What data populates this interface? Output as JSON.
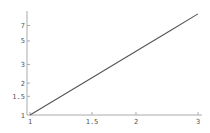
{
  "chart_data": {
    "type": "line",
    "title": "",
    "xlabel": "",
    "ylabel": "",
    "xscale": "log",
    "yscale": "log",
    "xlim": [
      1,
      3
    ],
    "ylim": [
      1,
      9
    ],
    "grid": false,
    "legend": null,
    "x_ticks": [
      {
        "value": 1,
        "label": "1"
      },
      {
        "value": 1.5,
        "label": "1.5"
      },
      {
        "value": 2,
        "label": "2"
      },
      {
        "value": 3,
        "label": "3"
      }
    ],
    "y_ticks": [
      {
        "value": 1,
        "label": "1"
      },
      {
        "value": 1.5,
        "label": "1.5"
      },
      {
        "value": 2,
        "label": "2"
      },
      {
        "value": 3,
        "label": "3"
      },
      {
        "value": 5,
        "label": "5"
      },
      {
        "value": 7,
        "label": "7"
      }
    ],
    "series": [
      {
        "name": "y = x^2",
        "x": [
          1,
          1.5,
          2,
          2.5,
          3
        ],
        "y": [
          1,
          2.25,
          4,
          6.25,
          9
        ],
        "color": "#555555"
      }
    ]
  },
  "colors": {
    "axis": "#aaaaaa",
    "line": "#555555",
    "text": "#555555"
  }
}
